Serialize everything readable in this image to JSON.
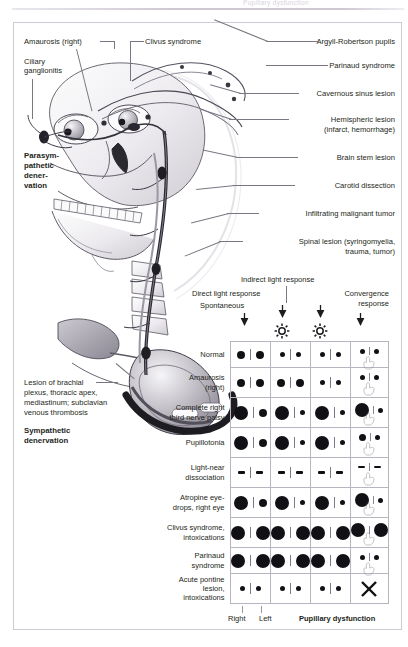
{
  "page": {
    "running_header": "Pupillary dysfunction",
    "accent_line": "#cfc9d4",
    "text_color": "#231f20",
    "leader_color": "#7b7681",
    "pupil_color": "#111014",
    "grid_color": "#b9b5c0"
  },
  "illustration": {
    "name": "head-neck-autonomic-pathways",
    "left_labels": [
      {
        "text": "Amaurosis (right)",
        "id": "amaurosis-right"
      },
      {
        "text": "Ciliary",
        "id": "ciliary-ganglionitis-line1"
      },
      {
        "text": "ganglionitis",
        "id": "ciliary-ganglionitis-line2"
      },
      {
        "text": "Parasym-",
        "id": "parasympathetic-denervation-line1"
      },
      {
        "text": "pathetic",
        "id": "parasympathetic-denervation-line2"
      },
      {
        "text": "dener-",
        "id": "parasympathetic-denervation-line3"
      },
      {
        "text": "vation",
        "id": "parasympathetic-denervation-line4"
      }
    ],
    "top_labels": [
      {
        "text": "Clivus syndrome",
        "id": "clivus-syndrome"
      }
    ],
    "right_labels": [
      {
        "text": "Argyll-Robertson pupils",
        "id": "argyll-robertson-pupils"
      },
      {
        "text": "Parinaud syndrome",
        "id": "parinaud-syndrome"
      },
      {
        "text": "Cavernous sinus lesion",
        "id": "cavernous-sinus-lesion"
      },
      {
        "text": "Hemispheric lesion",
        "id": "hemispheric-lesion-line1"
      },
      {
        "text": "(infarct, hemorrhage)",
        "id": "hemispheric-lesion-line2"
      },
      {
        "text": "Brain stem lesion",
        "id": "brain-stem-lesion"
      },
      {
        "text": "Carotid dissection",
        "id": "carotid-dissection"
      },
      {
        "text": "Infiltrating malignant tumor",
        "id": "infiltrating-malignant-tumor"
      },
      {
        "text": "Spinal lesion (syringomyelia,",
        "id": "spinal-lesion-line1"
      },
      {
        "text": "trauma, tumor)",
        "id": "spinal-lesion-line2"
      }
    ],
    "bottom_left_labels": [
      {
        "text": "Lesion of brachial",
        "id": "brachial-plexus-lesion-line1"
      },
      {
        "text": "plexus, thoracic apex,",
        "id": "brachial-plexus-lesion-line2"
      },
      {
        "text": "mediastinum; subclavian",
        "id": "brachial-plexus-lesion-line3"
      },
      {
        "text": "venous thrombosis",
        "id": "brachial-plexus-lesion-line4"
      },
      {
        "text": "Sympathetic",
        "id": "sympathetic-denervation-line1"
      },
      {
        "text": "denervation",
        "id": "sympathetic-denervation-line2"
      }
    ]
  },
  "table_header": {
    "indirect_light_response": "Indirect light response",
    "direct_light_response": "Direct light response",
    "spontaneous": "Spontaneous",
    "convergence_line1": "Convergence",
    "convergence_line2": "response",
    "icons": [
      {
        "name": "arrow-down-icon",
        "column": 1
      },
      {
        "name": "arrow-down-icon",
        "column": 2
      },
      {
        "name": "light-source-sun-icon",
        "column": 2
      },
      {
        "name": "arrow-down-icon",
        "column": 3
      },
      {
        "name": "light-source-sun-icon",
        "column": 3
      },
      {
        "name": "arrow-down-icon",
        "column": 4
      }
    ]
  },
  "table_footer": {
    "right": "Right",
    "left": "Left",
    "title": "Pupillary dysfunction"
  },
  "chart_data": {
    "type": "table",
    "title": "Pupillary dysfunction",
    "columns": [
      "Spontaneous",
      "Direct light response",
      "Indirect light response",
      "Convergence response"
    ],
    "sub_columns": [
      "Right",
      "Left"
    ],
    "rows": [
      {
        "label": "Normal",
        "label_lines": [
          "Normal"
        ],
        "cells": [
          {
            "type": "pair",
            "right": 8,
            "left": 8
          },
          {
            "type": "pair",
            "right": 5,
            "left": 5
          },
          {
            "type": "pair",
            "right": 5,
            "left": 5
          },
          {
            "type": "conv",
            "right": 5,
            "left": 5
          }
        ]
      },
      {
        "label": "Amaurosis (right)",
        "label_lines": [
          "Amaurosis",
          "(right)"
        ],
        "cells": [
          {
            "type": "pair",
            "right": 8,
            "left": 8
          },
          {
            "type": "pair",
            "right": 8,
            "left": 8
          },
          {
            "type": "pair",
            "right": 5,
            "left": 5
          },
          {
            "type": "conv",
            "right": 5,
            "left": 5
          }
        ]
      },
      {
        "label": "Complete right third nerve palsy",
        "label_lines": [
          "Complete right",
          "third nerve palsy"
        ],
        "cells": [
          {
            "type": "pair",
            "right": 14,
            "left": 8
          },
          {
            "type": "pair",
            "right": 14,
            "left": 5
          },
          {
            "type": "pair",
            "right": 14,
            "left": 5
          },
          {
            "type": "conv",
            "right": 14,
            "left": 5
          }
        ]
      },
      {
        "label": "Pupillotonia",
        "label_lines": [
          "Pupillotonia"
        ],
        "cells": [
          {
            "type": "pair",
            "right": 14,
            "left": 8
          },
          {
            "type": "pair",
            "right": 14,
            "left": 5
          },
          {
            "type": "pair",
            "right": 14,
            "left": 5
          },
          {
            "type": "conv",
            "right": 7,
            "left": 5
          }
        ]
      },
      {
        "label": "Light-near dissociation",
        "label_lines": [
          "Light-near",
          "dissociation"
        ],
        "cells": [
          {
            "type": "pair",
            "right": "dash",
            "left": "dash"
          },
          {
            "type": "pair",
            "right": "dash",
            "left": "dash"
          },
          {
            "type": "pair",
            "right": "dash",
            "left": "dash"
          },
          {
            "type": "conv",
            "right": "dash",
            "left": "dash"
          }
        ]
      },
      {
        "label": "Atropine eyedrops, right eye",
        "label_lines": [
          "Atropine eye-",
          "drops, right eye"
        ],
        "cells": [
          {
            "type": "pair",
            "right": 14,
            "left": 8
          },
          {
            "type": "pair",
            "right": 14,
            "left": 5
          },
          {
            "type": "pair",
            "right": 14,
            "left": 5
          },
          {
            "type": "conv",
            "right": 14,
            "left": 5
          }
        ]
      },
      {
        "label": "Clivus syndrome, intoxications",
        "label_lines": [
          "Clivus syndrome,",
          "intoxications"
        ],
        "cells": [
          {
            "type": "pair",
            "right": 14,
            "left": 14
          },
          {
            "type": "pair",
            "right": 14,
            "left": 14
          },
          {
            "type": "pair",
            "right": 14,
            "left": 14
          },
          {
            "type": "conv",
            "right": 14,
            "left": 14
          }
        ]
      },
      {
        "label": "Parinaud syndrome",
        "label_lines": [
          "Parinaud syndrome"
        ],
        "cells": [
          {
            "type": "pair",
            "right": 14,
            "left": 14
          },
          {
            "type": "pair",
            "right": 14,
            "left": 14
          },
          {
            "type": "pair",
            "right": 14,
            "left": 14
          },
          {
            "type": "conv",
            "right": 5,
            "left": 5
          }
        ]
      },
      {
        "label": "Acute pontine lesion, intoxications",
        "label_lines": [
          "Acute pontine",
          "lesion, intoxications"
        ],
        "cells": [
          {
            "type": "pair",
            "right": 5,
            "left": 5
          },
          {
            "type": "pair",
            "right": 5,
            "left": 5
          },
          {
            "type": "pair",
            "right": 5,
            "left": 5
          },
          {
            "type": "cross"
          }
        ]
      }
    ]
  }
}
